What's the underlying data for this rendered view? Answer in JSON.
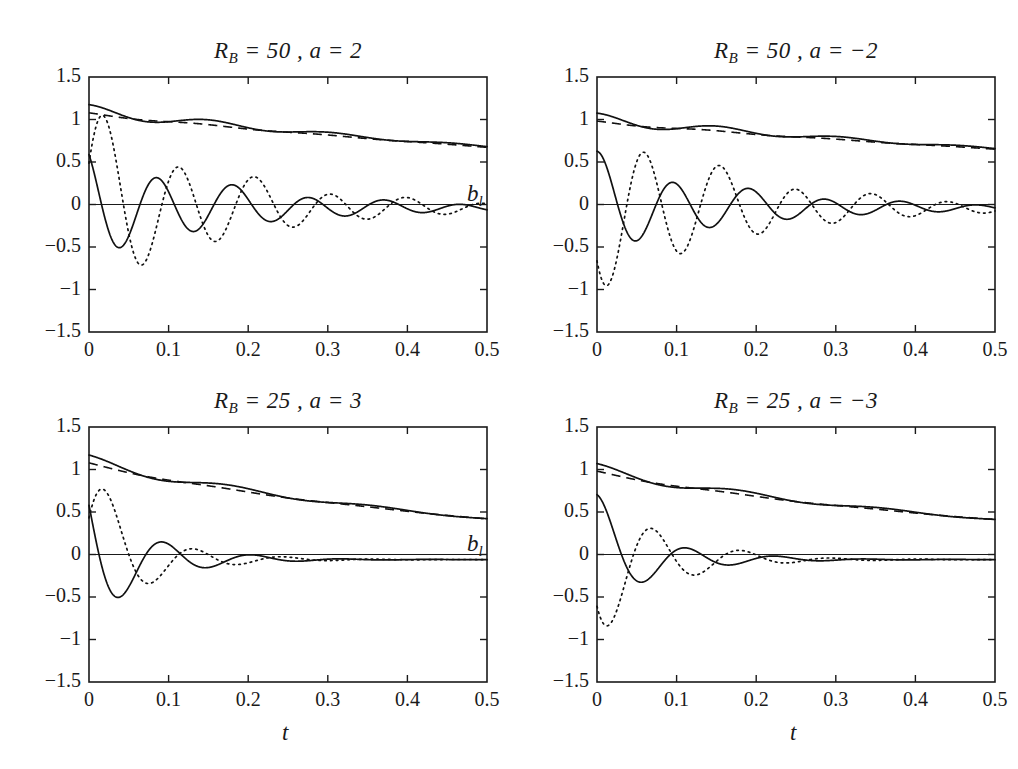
{
  "figure": {
    "width": 1018,
    "height": 769,
    "background": "#ffffff",
    "ink_color": "#111111"
  },
  "chart_data": [
    {
      "id": "top-left",
      "type": "line",
      "title": "R_B = 50 , a = 2",
      "title_parts": {
        "symbol": "R",
        "subscript": "B",
        "rb_value": "50",
        "a_symbol": "a",
        "a_value": "2"
      },
      "xlabel": "",
      "ylabel": "",
      "xlim": [
        0,
        0.5
      ],
      "ylim": [
        -1.5,
        1.5
      ],
      "xticks": [
        0,
        0.1,
        0.2,
        0.3,
        0.4,
        0.5
      ],
      "xtick_labels": [
        "0",
        "0.1",
        "0.2",
        "0.3",
        "0.4",
        "0.5"
      ],
      "yticks": [
        1.5,
        1,
        0.5,
        0,
        -0.5,
        -1,
        -1.5
      ],
      "ytick_labels": [
        "1.5",
        "1",
        "0.5",
        "0",
        "−0.5",
        "−1",
        "−1.5"
      ],
      "grid": false,
      "legend": "none",
      "params": {
        "R_B": 50,
        "a": 2,
        "decay_env": 0.9,
        "decay_osc": 5.6,
        "freq": 66,
        "phase_solid": 0.62,
        "phase_dotted": -1.2,
        "amp_solid": 0.62,
        "amp_dotted": 1.02,
        "offset_osc": -0.04,
        "env_start": 1.1,
        "env_end": 0.56,
        "ripple_amp": 0.075,
        "ripple_freq": 66
      },
      "series": [
        {
          "name": "envelope-solid",
          "style": "solid",
          "role": "upper-decay",
          "start_value": 1.1,
          "end_value": 0.56
        },
        {
          "name": "envelope-dashed",
          "style": "dashed",
          "role": "upper-decay-reference",
          "start_value": 1.05,
          "end_value": 0.56
        },
        {
          "name": "oscillation-solid",
          "style": "solid",
          "role": "lower-oscillation",
          "start_value": 0.5,
          "end_value": -0.07
        },
        {
          "name": "oscillation-dotted",
          "style": "dotted",
          "role": "lower-oscillation",
          "start_value": 0.0,
          "min_value": -0.88,
          "end_value": -0.05
        }
      ]
    },
    {
      "id": "top-right",
      "type": "line",
      "title": "R_B = 50 , a = −2",
      "title_parts": {
        "symbol": "R",
        "subscript": "B",
        "rb_value": "50",
        "a_symbol": "a",
        "a_value": "−2"
      },
      "xlabel": "",
      "ylabel": "b_l",
      "ylabel_parts": {
        "symbol": "b",
        "subscript": "l"
      },
      "xlim": [
        0,
        0.5
      ],
      "ylim": [
        -1.5,
        1.5
      ],
      "xticks": [
        0,
        0.1,
        0.2,
        0.3,
        0.4,
        0.5
      ],
      "xtick_labels": [
        "0",
        "0.1",
        "0.2",
        "0.3",
        "0.4",
        "0.5"
      ],
      "yticks": [
        1.5,
        1,
        0.5,
        0,
        -0.5,
        -1,
        -1.5
      ],
      "ytick_labels": [
        "1.5",
        "1",
        "0.5",
        "0",
        "−0.5",
        "−1",
        "−1.5"
      ],
      "grid": false,
      "legend": "none",
      "params": {
        "R_B": 50,
        "a": -2,
        "decay_env": 0.9,
        "decay_osc": 5.6,
        "freq": 66,
        "phase_solid": -0.05,
        "phase_dotted": 2.35,
        "amp_solid": 0.55,
        "amp_dotted": 1.02,
        "offset_osc": -0.04,
        "env_start": 1.0,
        "env_end": 0.56,
        "ripple_amp": 0.075,
        "ripple_freq": 66
      },
      "series": [
        {
          "name": "envelope-solid",
          "style": "solid",
          "role": "upper-decay",
          "start_value": 1.0,
          "end_value": 0.56
        },
        {
          "name": "envelope-dashed",
          "style": "dashed",
          "role": "upper-decay-reference",
          "start_value": 0.98,
          "end_value": 0.56
        },
        {
          "name": "oscillation-solid",
          "style": "solid",
          "role": "lower-oscillation",
          "start_value": 0.0,
          "min_value": -0.52,
          "end_value": -0.06
        },
        {
          "name": "oscillation-dotted",
          "style": "dotted",
          "role": "lower-oscillation",
          "start_value": -1.0,
          "end_value": -0.04
        }
      ]
    },
    {
      "id": "bottom-left",
      "type": "line",
      "title": "R_B = 25 , a = 3",
      "title_parts": {
        "symbol": "R",
        "subscript": "B",
        "rb_value": "25",
        "a_symbol": "a",
        "a_value": "3"
      },
      "xlabel": "t",
      "ylabel": "",
      "xlim": [
        0,
        0.5
      ],
      "ylim": [
        -1.5,
        1.5
      ],
      "xticks": [
        0,
        0.1,
        0.2,
        0.3,
        0.4,
        0.5
      ],
      "xtick_labels": [
        "0",
        "0.1",
        "0.2",
        "0.3",
        "0.4",
        "0.5"
      ],
      "yticks": [
        1.5,
        1,
        0.5,
        0,
        -0.5,
        -1,
        -1.5
      ],
      "ytick_labels": [
        "1.5",
        "1",
        "0.5",
        "0",
        "−0.5",
        "−1",
        "−1.5"
      ],
      "grid": false,
      "legend": "none",
      "params": {
        "R_B": 25,
        "a": 3,
        "decay_env": 1.9,
        "decay_osc": 14.0,
        "freq": 56,
        "phase_solid": 0.95,
        "phase_dotted": -1.2,
        "amp_solid": 0.82,
        "amp_dotted": 0.9,
        "offset_osc": -0.06,
        "env_start": 1.1,
        "env_end": 0.36,
        "ripple_amp": 0.07,
        "ripple_freq": 56
      },
      "series": [
        {
          "name": "envelope-solid",
          "style": "solid",
          "role": "upper-decay",
          "start_value": 1.1,
          "end_value": 0.36
        },
        {
          "name": "envelope-dashed",
          "style": "dashed",
          "role": "upper-decay-reference",
          "start_value": 1.02,
          "end_value": 0.36
        },
        {
          "name": "oscillation-solid",
          "style": "solid",
          "role": "lower-oscillation",
          "start_value": 0.75,
          "end_value": -0.08
        },
        {
          "name": "oscillation-dotted",
          "style": "dotted",
          "role": "lower-oscillation",
          "start_value": 0.0,
          "min_value": -0.72,
          "end_value": -0.03
        }
      ]
    },
    {
      "id": "bottom-right",
      "type": "line",
      "title": "R_B = 25 , a = −3",
      "title_parts": {
        "symbol": "R",
        "subscript": "B",
        "rb_value": "25",
        "a_symbol": "a",
        "a_value": "−3"
      },
      "xlabel": "t",
      "ylabel": "b_l",
      "ylabel_parts": {
        "symbol": "b",
        "subscript": "l"
      },
      "xlim": [
        0,
        0.5
      ],
      "ylim": [
        -1.5,
        1.5
      ],
      "xticks": [
        0,
        0.1,
        0.2,
        0.3,
        0.4,
        0.5
      ],
      "xtick_labels": [
        "0",
        "0.1",
        "0.2",
        "0.3",
        "0.4",
        "0.5"
      ],
      "yticks": [
        1.5,
        1,
        0.5,
        0,
        -0.5,
        -1,
        -1.5
      ],
      "ytick_labels": [
        "1.5",
        "1",
        "0.5",
        "0",
        "−0.5",
        "−1",
        "−1.5"
      ],
      "grid": false,
      "legend": "none",
      "params": {
        "R_B": 25,
        "a": -3,
        "decay_env": 1.9,
        "decay_osc": 13.0,
        "freq": 56,
        "phase_solid": -0.1,
        "phase_dotted": 2.3,
        "amp_solid": 0.62,
        "amp_dotted": 1.0,
        "offset_osc": -0.06,
        "env_start": 1.0,
        "env_end": 0.36,
        "ripple_amp": 0.07,
        "ripple_freq": 56
      },
      "series": [
        {
          "name": "envelope-solid",
          "style": "solid",
          "role": "upper-decay",
          "start_value": 1.0,
          "end_value": 0.36
        },
        {
          "name": "envelope-dashed",
          "style": "dashed",
          "role": "upper-decay-reference",
          "start_value": 0.98,
          "end_value": 0.36
        },
        {
          "name": "oscillation-solid",
          "style": "solid",
          "role": "lower-oscillation",
          "start_value": 0.0,
          "min_value": -0.58,
          "end_value": -0.05
        },
        {
          "name": "oscillation-dotted",
          "style": "dotted",
          "role": "lower-oscillation",
          "start_value": -1.0,
          "end_value": -0.03
        }
      ]
    }
  ]
}
